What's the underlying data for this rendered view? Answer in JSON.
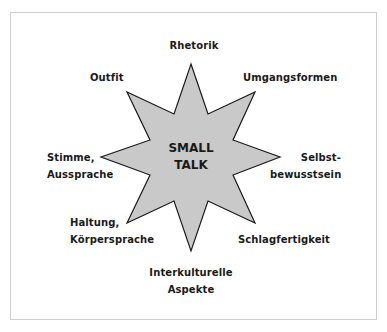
{
  "diagram": {
    "type": "star-concept-map",
    "center": {
      "line1": "SMALL",
      "line2": "TALK"
    },
    "star": {
      "fill": "#c9c9c9",
      "stroke": "#1a1a1a",
      "points": 8
    },
    "frame_color": "#cfcfcf",
    "labels": {
      "top": {
        "line1": "Rhetorik"
      },
      "top_right": {
        "line1": "Umgangsformen"
      },
      "right": {
        "line1": "Selbst-",
        "line2": "bewusstsein"
      },
      "bottom_right": {
        "line1": "Schlagfertigkeit"
      },
      "bottom": {
        "line1": "Interkulturelle",
        "line2": "Aspekte"
      },
      "bottom_left": {
        "line1": "Haltung,",
        "line2": "Körpersprache"
      },
      "left": {
        "line1": "Stimme,",
        "line2": "Aussprache"
      },
      "top_left": {
        "line1": "Outfit"
      }
    }
  }
}
